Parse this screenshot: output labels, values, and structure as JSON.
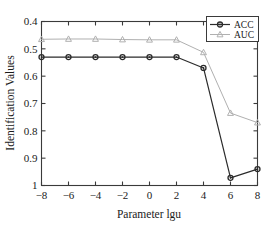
{
  "chart_data": {
    "type": "line",
    "title": "",
    "xlabel": "Parameter lgu",
    "ylabel": "Identification Values",
    "x": [
      -8,
      -6,
      -4,
      -2,
      0,
      2,
      4,
      6,
      8
    ],
    "xlim": [
      -8,
      8
    ],
    "ylim": [
      0.4,
      1
    ],
    "xticks": [
      -8,
      -6,
      -4,
      -2,
      0,
      2,
      4,
      6,
      8
    ],
    "xtick_labels": [
      "−8",
      "−6",
      "−4",
      "−2",
      "0",
      "2",
      "4",
      "6",
      "8"
    ],
    "yticks": [
      0.4,
      0.5,
      0.6,
      0.7,
      0.8,
      0.9,
      1
    ],
    "ytick_labels": [
      "0.4",
      "0.5",
      "0.6",
      "0.7",
      "0.8",
      "0.9",
      "1"
    ],
    "grid": false,
    "legend_position": "top-right-inside",
    "series": [
      {
        "name": "ACC",
        "color": "#2b2b2b",
        "marker": "circle",
        "values": [
          0.87,
          0.87,
          0.87,
          0.87,
          0.87,
          0.87,
          0.83,
          0.428,
          0.46
        ]
      },
      {
        "name": "AUC",
        "color": "#b0b0b0",
        "marker": "triangle",
        "values": [
          0.935,
          0.936,
          0.936,
          0.934,
          0.933,
          0.933,
          0.887,
          0.665,
          0.63
        ]
      }
    ]
  },
  "legend": {
    "entries": [
      {
        "label": "ACC"
      },
      {
        "label": "AUC"
      }
    ]
  },
  "axes": {
    "x_title": "Parameter lgu",
    "y_title": "Identification Values",
    "x_labels": [
      "−8",
      "−6",
      "−4",
      "−2",
      "0",
      "2",
      "4",
      "6",
      "8"
    ],
    "y_labels": [
      "1",
      "0.9",
      "0.8",
      "0.7",
      "0.6",
      "0.5",
      "0.4"
    ]
  },
  "colors": {
    "acc": "#2b2b2b",
    "auc": "#b0b0b0",
    "axis": "#3a3a3a",
    "background": "#ffffff"
  }
}
